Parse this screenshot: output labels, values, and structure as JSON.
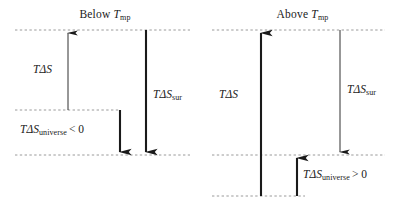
{
  "figure": {
    "kind": "thermodynamics-entropy-diagram",
    "width": 399,
    "height": 212,
    "background": "#ffffff",
    "ink_color": "#1a1a1a",
    "dashed_line_color": "#9a9a9a"
  },
  "panels": [
    {
      "id": "below-mp",
      "title_prefix": "Below ",
      "title_symbol": "T",
      "title_subscript": "mp",
      "levels": [
        {
          "name": "top-level-line",
          "y": 30,
          "x1": 15,
          "x2": 190
        },
        {
          "name": "middle-level-line",
          "y": 110,
          "x1": 15,
          "x2": 120
        },
        {
          "name": "bottom-level-line",
          "y": 155,
          "x1": 15,
          "x2": 190
        }
      ],
      "arrows": [
        {
          "name": "t-delta-s-arrow",
          "x": 68,
          "from_y": 110,
          "to_y": 30,
          "direction": "up",
          "weight": "thin",
          "label": {
            "symbol": "TΔS",
            "subscript": "",
            "relation": ""
          }
        },
        {
          "name": "t-delta-s-universe-arrow",
          "x": 120,
          "from_y": 110,
          "to_y": 155,
          "direction": "down",
          "weight": "thick",
          "label": {
            "symbol": "TΔS",
            "subscript": "universe",
            "relation": "< 0"
          }
        },
        {
          "name": "t-delta-s-sur-arrow",
          "x": 146,
          "from_y": 30,
          "to_y": 155,
          "direction": "down",
          "weight": "thick",
          "label": {
            "symbol": "TΔS",
            "subscript": "sur",
            "relation": ""
          }
        }
      ]
    },
    {
      "id": "above-mp",
      "title_prefix": "Above ",
      "title_symbol": "T",
      "title_subscript": "mp",
      "levels": [
        {
          "name": "top-level-line",
          "y": 30,
          "x1": 212,
          "x2": 385
        },
        {
          "name": "middle-level-line",
          "y": 155,
          "x1": 212,
          "x2": 385
        },
        {
          "name": "bottom-level-line",
          "y": 196,
          "x1": 212,
          "x2": 305
        }
      ],
      "arrows": [
        {
          "name": "t-delta-s-arrow",
          "x": 261,
          "from_y": 196,
          "to_y": 30,
          "direction": "up",
          "weight": "thick",
          "label": {
            "symbol": "TΔS",
            "subscript": "",
            "relation": ""
          }
        },
        {
          "name": "t-delta-s-universe-arrow",
          "x": 297,
          "from_y": 196,
          "to_y": 155,
          "direction": "up",
          "weight": "thick",
          "label": {
            "symbol": "TΔS",
            "subscript": "universe",
            "relation": "> 0"
          }
        },
        {
          "name": "t-delta-s-sur-arrow",
          "x": 340,
          "from_y": 30,
          "to_y": 155,
          "direction": "down",
          "weight": "thin",
          "label": {
            "symbol": "TΔS",
            "subscript": "sur",
            "relation": ""
          }
        }
      ]
    }
  ],
  "left": {
    "title": {
      "prefix": "Below ",
      "symbol": "T",
      "sub": "mp"
    },
    "t_delta_s": {
      "symbol": "TΔS"
    },
    "t_delta_s_universe": {
      "symbol": "TΔS",
      "sub": "universe",
      "rel": "< 0"
    },
    "t_delta_s_sur": {
      "symbol": "TΔS",
      "sub": "sur"
    }
  },
  "right": {
    "title": {
      "prefix": "Above ",
      "symbol": "T",
      "sub": "mp"
    },
    "t_delta_s": {
      "symbol": "TΔS"
    },
    "t_delta_s_universe": {
      "symbol": "TΔS",
      "sub": "universe",
      "rel": "> 0"
    },
    "t_delta_s_sur": {
      "symbol": "TΔS",
      "sub": "sur"
    }
  }
}
